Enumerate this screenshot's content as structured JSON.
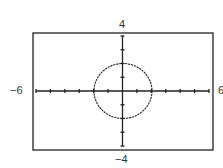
{
  "chart_data": {
    "type": "line",
    "title": "",
    "xlabel": "",
    "ylabel": "",
    "xlim": [
      -6,
      6
    ],
    "ylim": [
      -4,
      4
    ],
    "x_tick_step": 1,
    "y_tick_step": 1,
    "grid": false,
    "window_labels": {
      "xmin": "−6",
      "xmax": "6",
      "ymin": "−4",
      "ymax": "4"
    },
    "series": [
      {
        "name": "circle",
        "equation": "x^2 + y^2 = 4",
        "center": [
          0,
          0
        ],
        "radius": 2,
        "color": "#222222"
      }
    ]
  }
}
